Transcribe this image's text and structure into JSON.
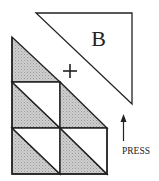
{
  "diagram": {
    "piece_label": "B",
    "placement_marker": "+",
    "action_label": "PRESS",
    "icons": {
      "marker": "plus-icon",
      "action_arrow": "arrow-up-icon"
    },
    "colors": {
      "stroke": "#222222",
      "shade": "#c4c4c4",
      "shade_dot": "#9a9a9a",
      "background": "#ffffff"
    },
    "grid": {
      "description": "Staircase of squares each split by a top-left to bottom-right diagonal; lower-left halves shaded",
      "rows": [
        {
          "row": 1,
          "cells": 1,
          "note": "top step: single shaded triangle"
        },
        {
          "row": 2,
          "cells": 2,
          "note": "left: split square; right: shaded triangle"
        },
        {
          "row": 3,
          "cells": 2,
          "note": "two split squares"
        }
      ]
    }
  }
}
